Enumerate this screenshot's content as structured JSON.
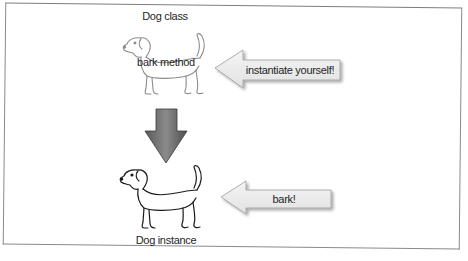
{
  "diagram": {
    "class_label": "Dog class",
    "method_label": "bark method",
    "instance_label": "Dog instance",
    "arrows": [
      {
        "id": "instantiate",
        "label": "instantiate yourself!",
        "direction": "left",
        "target": "Dog class"
      },
      {
        "id": "bark",
        "label": "bark!",
        "direction": "left",
        "target": "Dog instance"
      },
      {
        "id": "class-to-instance",
        "label": "",
        "direction": "down",
        "from": "Dog class",
        "to": "Dog instance"
      }
    ],
    "colors": {
      "callout_fill": "#ececec",
      "callout_stroke": "#9a9a9a",
      "down_arrow_fill": "#6e6e6e",
      "class_dog_stroke": "#8c8c8c",
      "instance_dog_stroke": "#1a1a1a",
      "frame": "#8a8a8a"
    }
  }
}
